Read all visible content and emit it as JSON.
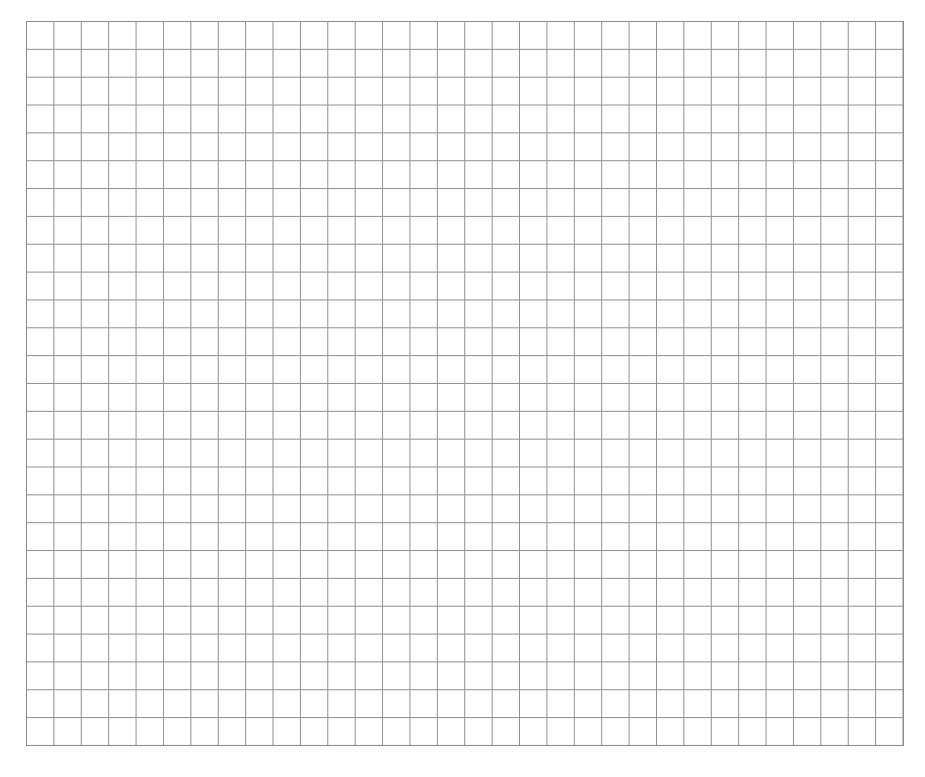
{
  "page": {
    "width": 925,
    "height": 777,
    "background_color": "#ffffff"
  },
  "grid": {
    "name": "grid-paper",
    "description": "Blank square grid / graph paper scan with no annotations, labels or marks",
    "origin_x": 26,
    "origin_y": 21,
    "right_x": 903,
    "bottom_y": 745,
    "columns": 32,
    "rows": 26,
    "cell_width": 27.4,
    "cell_height": 27.85,
    "line_color": "#8e8e94",
    "line_width": 1,
    "border_color": "#8a8a90",
    "border_width": 1,
    "fill_color": "#ffffff",
    "has_labels": false,
    "has_content": false
  },
  "chart_data": {
    "type": "table",
    "title": "",
    "xlabel": "",
    "ylabel": "",
    "columns": 32,
    "rows": 26,
    "categories": [],
    "values": [],
    "grid": true,
    "legend": "none",
    "annotations": []
  }
}
